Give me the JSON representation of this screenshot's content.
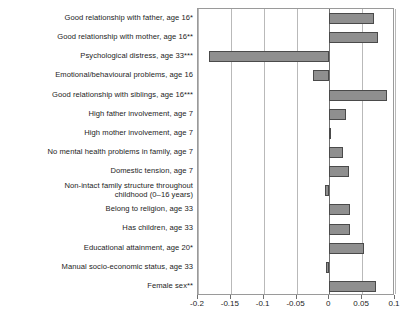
{
  "chart_data": {
    "type": "bar",
    "orientation": "horizontal",
    "title": "",
    "subtitle": "",
    "xlabel": "",
    "ylabel": "",
    "xlim": [
      -0.2,
      0.1
    ],
    "ylim": [
      0,
      15
    ],
    "grid": true,
    "legend": false,
    "legend_position": "none",
    "bar_color": "#8f8f8f",
    "bar_edge_color": "#4a4a4a",
    "zero_line_color": "#6e6e6e",
    "gridline_color": "#b9b9b9",
    "xticks": [
      -0.2,
      -0.15,
      -0.1,
      -0.05,
      0,
      0.05,
      0.1
    ],
    "xtick_labels": [
      "-0.2",
      "-0.15",
      "-0.1",
      "-0.05",
      "0",
      "0.05",
      "0.1"
    ],
    "categories": [
      "Good relationship with father, age 16*",
      "Good relationship with mother, age 16**",
      "Psychological distress, age 33***",
      "Emotional/behavioural problems, age 16",
      "Good relationship with siblings, age 16***",
      "High father involvement, age 7",
      "High mother involvement, age 7",
      "No mental health problems in family, age 7",
      "Domestic tension, age 7",
      "Non-intact family structure throughout\nchildhood (0–16 years)",
      "Belong to religion, age 33",
      "Has children, age 33",
      "Educational attainment, age 20*",
      "Manual socio-economic status, age 33",
      "Female sex**"
    ],
    "values": [
      0.0685,
      0.0735,
      -0.1835,
      -0.0255,
      0.0885,
      0.0255,
      0.0025,
      0.0215,
      0.0295,
      -0.0065,
      0.0315,
      0.0315,
      0.0535,
      -0.0055,
      0.0705
    ]
  }
}
